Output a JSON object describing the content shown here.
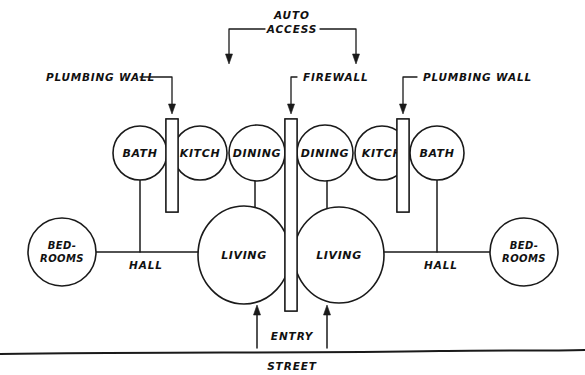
{
  "diagram": {
    "type": "architectural-bubble-diagram",
    "background_color": "#ffffff",
    "ink_color": "#1a1a1a"
  },
  "bubbles": {
    "upper_row": [
      {
        "id": "bath-left",
        "label": "BATH",
        "cx": 140,
        "cy": 153,
        "rx": 27,
        "ry": 27
      },
      {
        "id": "kitch-left",
        "label": "KITCH",
        "cx": 200,
        "cy": 153,
        "rx": 27,
        "ry": 27
      },
      {
        "id": "dining-left",
        "label": "DINING",
        "cx": 257,
        "cy": 153,
        "rx": 28,
        "ry": 28
      },
      {
        "id": "dining-right",
        "label": "DINING",
        "cx": 325,
        "cy": 153,
        "rx": 28,
        "ry": 28
      },
      {
        "id": "kitch-right",
        "label": "KITCH",
        "cx": 382,
        "cy": 153,
        "rx": 27,
        "ry": 27
      },
      {
        "id": "bath-right",
        "label": "BATH",
        "cx": 437,
        "cy": 153,
        "rx": 27,
        "ry": 27
      }
    ],
    "lower_row": [
      {
        "id": "bedrooms-left",
        "label_line1": "BED-",
        "label_line2": "ROOMS",
        "cx": 62,
        "cy": 252,
        "rx": 34,
        "ry": 34
      },
      {
        "id": "living-left",
        "label_line1": "LIVING",
        "label_line2": "",
        "cx": 244,
        "cy": 255,
        "rx": 46,
        "ry": 49
      },
      {
        "id": "living-right",
        "label_line1": "LIVING",
        "label_line2": "",
        "cx": 339,
        "cy": 255,
        "rx": 45,
        "ry": 48
      },
      {
        "id": "bedrooms-right",
        "label_line1": "BED-",
        "label_line2": "ROOMS",
        "cx": 524,
        "cy": 252,
        "rx": 34,
        "ry": 34
      }
    ]
  },
  "walls": [
    {
      "id": "plumbing-wall-left",
      "kind": "plumbing",
      "x": 166,
      "y": 119,
      "w": 12,
      "h": 93
    },
    {
      "id": "firewall",
      "kind": "fire",
      "x": 285,
      "y": 119,
      "w": 12,
      "h": 192
    },
    {
      "id": "plumbing-wall-right",
      "kind": "plumbing",
      "x": 397,
      "y": 119,
      "w": 12,
      "h": 93
    }
  ],
  "callouts": {
    "auto_access": {
      "line1": "AUTO",
      "line2": "ACCESS"
    },
    "plumbing_wall_left": {
      "text": "PLUMBING WALL"
    },
    "firewall": {
      "text": "FIREWALL"
    },
    "plumbing_wall_right": {
      "text": "PLUMBING WALL"
    }
  },
  "connectors": {
    "hall_left_label": "HALL",
    "hall_right_label": "HALL",
    "entry_label": "ENTRY",
    "street_label": "STREET"
  }
}
